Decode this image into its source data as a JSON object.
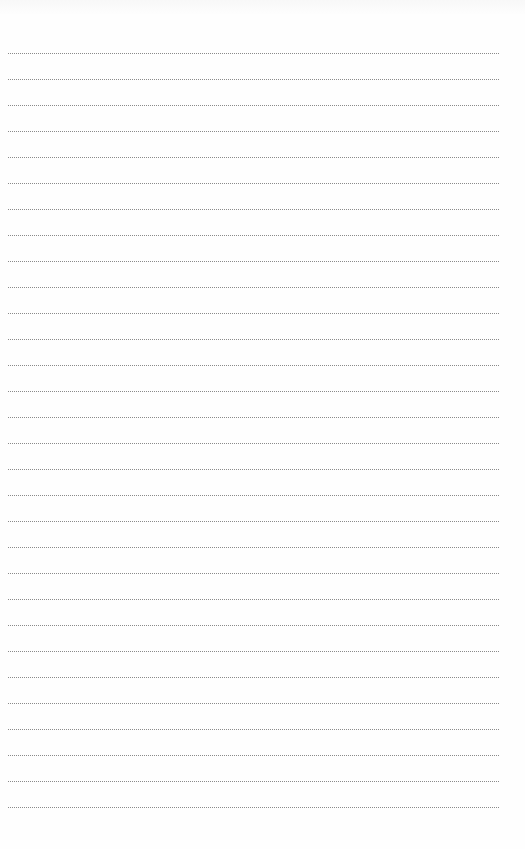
{
  "document": {
    "type": "blank lined writing page",
    "line_style": "dotted",
    "line_color": "#8a8a8a",
    "background": "#ffffff",
    "line_count": 30,
    "first_line_y": 53,
    "line_spacing": 26,
    "line_left": 8,
    "line_width": 491
  }
}
